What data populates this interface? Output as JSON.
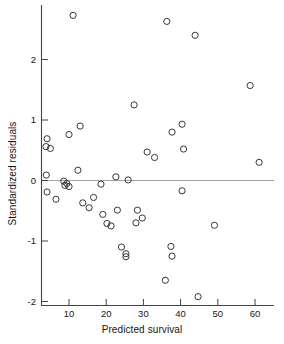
{
  "chart_data": {
    "type": "scatter",
    "title": "",
    "xlabel": "Predicted survival",
    "ylabel": "Standardized residuals",
    "xlim": [
      3.0,
      63.5
    ],
    "ylim": [
      -2.15,
      2.85
    ],
    "xticks": [
      10,
      20,
      30,
      40,
      50,
      60
    ],
    "yticks": [
      -2,
      -1,
      0,
      1,
      2
    ],
    "xticklabels": [
      "10",
      "20",
      "30",
      "40",
      "50",
      "60"
    ],
    "yticklabels": [
      "-2",
      "-1",
      "0",
      "1",
      "2"
    ],
    "grid": false,
    "legend": null,
    "reference_lines": [
      {
        "type": "horizontal",
        "y": 0.0,
        "color": "#9a9a9a"
      }
    ],
    "marker": {
      "shape": "circle-open",
      "size": 3.1,
      "edge_color": "#2c2c2c",
      "fill": "none"
    },
    "series": [
      {
        "name": "residuals",
        "points": [
          [
            11.1,
            2.73
          ],
          [
            36.3,
            2.63
          ],
          [
            43.9,
            2.4
          ],
          [
            58.7,
            1.57
          ],
          [
            27.5,
            1.25
          ],
          [
            13.0,
            0.9
          ],
          [
            10.0,
            0.76
          ],
          [
            37.7,
            0.8
          ],
          [
            40.4,
            0.93
          ],
          [
            4.1,
            0.69
          ],
          [
            3.8,
            0.56
          ],
          [
            5.0,
            0.53
          ],
          [
            40.8,
            0.52
          ],
          [
            31.0,
            0.47
          ],
          [
            33.0,
            0.38
          ],
          [
            61.1,
            0.3
          ],
          [
            12.4,
            0.17
          ],
          [
            3.9,
            0.09
          ],
          [
            22.6,
            0.06
          ],
          [
            25.9,
            0.01
          ],
          [
            8.6,
            -0.01
          ],
          [
            8.9,
            -0.08
          ],
          [
            10.0,
            -0.1
          ],
          [
            9.4,
            -0.05
          ],
          [
            18.6,
            -0.06
          ],
          [
            40.4,
            -0.17
          ],
          [
            4.1,
            -0.19
          ],
          [
            6.5,
            -0.31
          ],
          [
            16.6,
            -0.28
          ],
          [
            13.7,
            -0.37
          ],
          [
            15.4,
            -0.45
          ],
          [
            23.0,
            -0.49
          ],
          [
            28.4,
            -0.49
          ],
          [
            19.1,
            -0.56
          ],
          [
            29.7,
            -0.62
          ],
          [
            20.2,
            -0.71
          ],
          [
            21.3,
            -0.75
          ],
          [
            28.0,
            -0.7
          ],
          [
            49.1,
            -0.74
          ],
          [
            24.1,
            -1.1
          ],
          [
            37.4,
            -1.09
          ],
          [
            25.3,
            -1.21
          ],
          [
            25.3,
            -1.26
          ],
          [
            37.7,
            -1.25
          ],
          [
            35.9,
            -1.65
          ],
          [
            44.7,
            -1.92
          ]
        ]
      }
    ]
  },
  "figure": {
    "axis_color": "#444444",
    "zero_line_color": "#9a9a9a",
    "background": "#ffffff"
  }
}
